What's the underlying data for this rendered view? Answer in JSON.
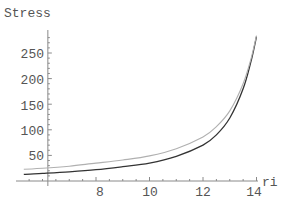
{
  "chart_data": {
    "type": "line",
    "title": "",
    "xlabel": "ri",
    "ylabel": "Stress",
    "xlim": [
      5.3,
      14.0
    ],
    "ylim": [
      0,
      290
    ],
    "axes_origin": {
      "x": 6.2,
      "y": 0
    },
    "xticks": [
      8,
      10,
      12,
      14
    ],
    "yticks": [
      50,
      100,
      150,
      200,
      250
    ],
    "grid": false,
    "legend": null,
    "series": [
      {
        "name": "dark curve",
        "color": "#333333",
        "x": [
          5.3,
          6,
          7,
          8,
          9,
          10,
          11,
          12,
          12.5,
          13,
          13.5,
          13.8,
          14.0
        ],
        "y": [
          13,
          15,
          18,
          22,
          28,
          35,
          48,
          70,
          90,
          123,
          180,
          235,
          282
        ]
      },
      {
        "name": "light curve",
        "color": "#b0b0b0",
        "x": [
          5.3,
          6,
          7,
          8,
          9,
          10,
          11,
          12,
          12.5,
          13,
          13.5,
          13.8,
          14.0
        ],
        "y": [
          23,
          25,
          29,
          35,
          41,
          49,
          63,
          86,
          106,
          137,
          190,
          240,
          284
        ]
      }
    ]
  },
  "labels": {
    "y_title": "Stress",
    "x_title": "ri",
    "x_ticks": [
      "8",
      "10",
      "12",
      "14"
    ],
    "y_ticks": [
      "50",
      "100",
      "150",
      "200",
      "250"
    ]
  }
}
